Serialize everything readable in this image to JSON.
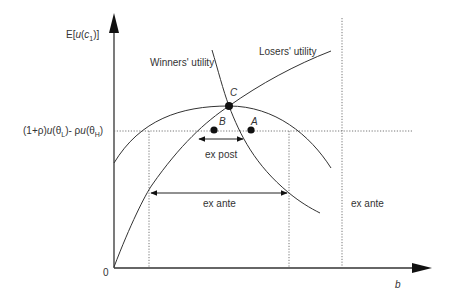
{
  "figure": {
    "y_axis_label": {
      "prefix": "E[",
      "u": "u",
      "paren_open": "(",
      "c": "c",
      "sub": "1",
      "suffix": ")]"
    },
    "x_axis_label": "b",
    "origin_label": "0",
    "threshold_label": {
      "part1": "(1+",
      "rho1": "ρ",
      "part2": ")",
      "u1": "u",
      "part3": "(θ",
      "sub1": "L",
      "part4": ")- ",
      "rho2": "ρ",
      "u2": "u",
      "part5": "(θ",
      "sub2": "H",
      "part6": ")"
    },
    "curves": {
      "winners": "Winners' utility",
      "losers": "Losers' utility"
    },
    "points": {
      "C": "C",
      "B": "B",
      "A": "A"
    },
    "annotations": {
      "ex_post": "ex post",
      "ex_ante_inner": "ex ante",
      "ex_ante_outer": "ex ante"
    }
  }
}
